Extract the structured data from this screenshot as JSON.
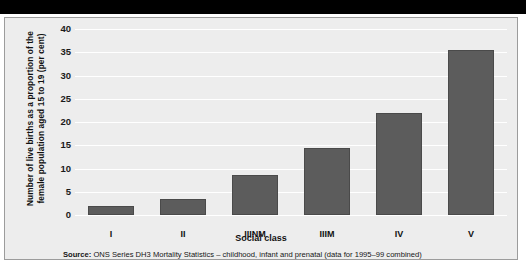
{
  "figure": {
    "source_prefix": "Source:",
    "source_text": "ONS Series DH3 Mortality Statistics – childhood, infant and prenatal (data for 1995–99 combined)",
    "colors": {
      "bar_fill": "#5c5c5c",
      "bar_edge": "#4a4a4a",
      "plot_background": "#ededed",
      "gridline": "#ffffff",
      "top_band": "#000000",
      "frame_border": "#9c9c9c"
    }
  },
  "chart_data": {
    "type": "bar",
    "title": "",
    "xlabel": "Social class",
    "ylabel": "Number of live births as a proportion of the female population aged 15 to 19 (per cent)",
    "ylabel_line1": "Number of live births as a proportion of the",
    "ylabel_line2": "female population aged 15 to 19 (per cent)",
    "categories": [
      "I",
      "II",
      "IIINM",
      "IIIM",
      "IV",
      "V"
    ],
    "values": [
      2,
      3.5,
      8.5,
      14.5,
      22,
      35.5
    ],
    "ylim": [
      0,
      40
    ],
    "yticks": [
      0,
      5,
      10,
      15,
      20,
      25,
      30,
      35,
      40
    ],
    "ytick_labels": [
      "0",
      "5",
      "10",
      "15",
      "20",
      "25",
      "30",
      "35",
      "40"
    ],
    "grid": true,
    "legend": null,
    "legend_position": "none"
  }
}
